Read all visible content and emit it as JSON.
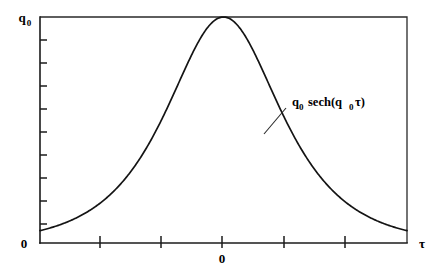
{
  "figure": {
    "background_color": "#ffffff",
    "ink_color": "#141414",
    "width": 439,
    "height": 271
  },
  "labels": {
    "y_axis_top": "q",
    "y_axis_top_sub": "0",
    "y_axis_bottom": "0",
    "x_axis_origin": "0",
    "x_axis_symbol": "τ",
    "annotation_q": "q",
    "annotation_q_sub": "0",
    "annotation_sech_open": "sech(q",
    "annotation_sech_sub": "0",
    "annotation_sech_close": "τ)"
  },
  "chart_data": {
    "type": "line",
    "title": "",
    "xlabel": "τ",
    "ylabel": "q₀",
    "function": "q0 * sech(q0 * tau)",
    "legend": [],
    "annotations": [
      {
        "text": "q₀ sech(q₀τ)",
        "x_px": 290,
        "y_px": 104,
        "leader_from_px": [
          286,
          108
        ],
        "leader_to_px": [
          264,
          134
        ]
      }
    ],
    "grid": false,
    "xlim": [
      -3.6,
      3.6
    ],
    "ylim": [
      0,
      1
    ],
    "x_tick_labels": [
      "",
      "",
      "0",
      "",
      ""
    ],
    "y_tick_labels": [
      "0",
      "",
      "",
      "",
      "",
      "",
      "",
      "",
      "",
      "",
      "q₀"
    ],
    "x_ticks_px": [
      100,
      161,
      222,
      284,
      345
    ],
    "y_ticks_px": [
      40,
      63,
      86,
      109,
      132,
      155,
      178,
      201,
      224
    ],
    "x": [
      -3.6,
      -3.4,
      -3.2,
      -3.0,
      -2.8,
      -2.6,
      -2.4,
      -2.2,
      -2.0,
      -1.8,
      -1.6,
      -1.4,
      -1.2,
      -1.0,
      -0.8,
      -0.6,
      -0.4,
      -0.2,
      0.0,
      0.2,
      0.4,
      0.6,
      0.8,
      1.0,
      1.2,
      1.4,
      1.6,
      1.8,
      2.0,
      2.2,
      2.4,
      2.6,
      2.8,
      3.0,
      3.2,
      3.4,
      3.6
    ],
    "y": [
      0.0546,
      0.0666,
      0.0814,
      0.0993,
      0.1212,
      0.1478,
      0.1801,
      0.2191,
      0.2658,
      0.3212,
      0.386,
      0.4605,
      0.5441,
      0.6481,
      0.7477,
      0.8436,
      0.9216,
      0.9802,
      1.0,
      0.9802,
      0.9216,
      0.8436,
      0.7477,
      0.6481,
      0.5441,
      0.4605,
      0.386,
      0.3212,
      0.2658,
      0.2191,
      0.1801,
      0.1478,
      0.1212,
      0.0993,
      0.0814,
      0.0666,
      0.0546
    ],
    "peak": {
      "x": 0.0,
      "y": 1.0
    },
    "plot_area_px": {
      "left": 40,
      "top": 17,
      "right": 407,
      "bottom": 243
    }
  }
}
